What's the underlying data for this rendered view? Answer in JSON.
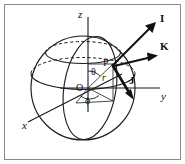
{
  "figure": {
    "width": 185,
    "height": 164,
    "background_color": "#ffffff",
    "frame_color": "#8a8a8a",
    "ink_color": "#111111"
  },
  "axes": [
    {
      "name": "z-axis",
      "label": "z",
      "style": "italic",
      "x": 80,
      "y": 14
    },
    {
      "name": "y-axis",
      "label": "y",
      "style": "italic",
      "x": 163,
      "y": 97
    },
    {
      "name": "x-axis",
      "label": "x",
      "style": "italic",
      "x": 24,
      "y": 125
    }
  ],
  "points": [
    {
      "name": "origin",
      "label": "O",
      "x": 80,
      "y": 86
    },
    {
      "name": "point-p",
      "label": "P",
      "x": 103,
      "y": 62
    }
  ],
  "angles": [
    {
      "name": "theta",
      "label": "θ",
      "x": 94,
      "y": 71,
      "description": "polar angle from z-axis to radius OP"
    },
    {
      "name": "phi",
      "label": "ϕ",
      "x": 86,
      "y": 99,
      "description": "azimuthal angle in xy-plane from x-axis"
    }
  ],
  "lengths": [
    {
      "name": "radius",
      "label": "r",
      "x": 103,
      "y": 78,
      "description": "radial distance from origin O to point P"
    }
  ],
  "vectors": [
    {
      "name": "vector-i",
      "label": "I",
      "x": 163,
      "y": 17,
      "direction": "up-right",
      "description": "radial unit vector at P"
    },
    {
      "name": "vector-k",
      "label": "K",
      "x": 163,
      "y": 45,
      "direction": "right",
      "description": "azimuthal unit vector at P"
    },
    {
      "name": "vector-j",
      "label": "J",
      "x": 131,
      "y": 79,
      "direction": "down-right",
      "description": "polar unit vector at P"
    }
  ],
  "curves": [
    {
      "name": "sphere-outline",
      "type": "circle",
      "style": "solid"
    },
    {
      "name": "upper-latitude-circle",
      "type": "ellipse",
      "style": "solid-front-dashed-back"
    },
    {
      "name": "equator-circle",
      "type": "ellipse",
      "style": "solid-front-dashed-back"
    },
    {
      "name": "meridian-through-p",
      "type": "ellipse",
      "style": "solid"
    }
  ]
}
